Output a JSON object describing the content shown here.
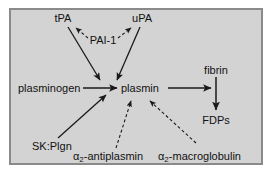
{
  "diagram": {
    "frame": {
      "background_color": "#d3d3d3",
      "border_color": "#8a8a8a",
      "outer_background": "#ffffff"
    },
    "nodes": {
      "tpa": "tPA",
      "upa": "uPA",
      "pai1": "PAI-1",
      "plasminogen": "plasminogen",
      "plasmin": "plasmin",
      "sk_plgn": "SK:Plgn",
      "fibrin": "fibrin",
      "fdps": "FDPs",
      "antiplasmin_alpha": "α",
      "antiplasmin_sub": "2",
      "antiplasmin_rest": "-antiplasmin",
      "macroglobulin_alpha": "α",
      "macroglobulin_sub": "2",
      "macroglobulin_rest": "-macroglobulin"
    },
    "edges": [
      {
        "from": "PAI-1",
        "to": "tPA",
        "style": "dashed",
        "meaning": "inhibition"
      },
      {
        "from": "PAI-1",
        "to": "uPA",
        "style": "dashed",
        "meaning": "inhibition"
      },
      {
        "from": "tPA",
        "to": "plasminogen-to-plasmin",
        "style": "solid",
        "meaning": "activation"
      },
      {
        "from": "uPA",
        "to": "plasminogen-to-plasmin",
        "style": "solid",
        "meaning": "activation"
      },
      {
        "from": "plasminogen",
        "to": "plasmin",
        "style": "solid",
        "meaning": "conversion"
      },
      {
        "from": "SK:Plgn",
        "to": "plasmin",
        "style": "solid",
        "meaning": "activation"
      },
      {
        "from": "plasmin",
        "to": "fibrin-to-FDPs",
        "style": "solid",
        "meaning": "catalysis"
      },
      {
        "from": "fibrin",
        "to": "FDPs",
        "style": "solid",
        "meaning": "degradation"
      },
      {
        "from": "α2-antiplasmin",
        "to": "plasmin",
        "style": "dashed",
        "meaning": "inhibition"
      },
      {
        "from": "α2-macroglobulin",
        "to": "plasmin",
        "style": "dashed",
        "meaning": "inhibition"
      }
    ],
    "colors": {
      "line": "#1a1a1a",
      "text": "#111111"
    }
  }
}
